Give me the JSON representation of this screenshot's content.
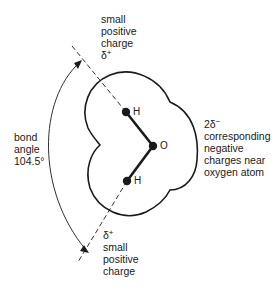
{
  "diagram": {
    "type": "water molecule polarity diagram",
    "atoms": {
      "hydrogen_top": "H",
      "hydrogen_bottom": "H",
      "oxygen": "O"
    },
    "top_label": {
      "line1": "small",
      "line2": "positive",
      "line3": "charge",
      "delta": "δ",
      "delta_sup": "+"
    },
    "bottom_label": {
      "delta": "δ",
      "delta_sup": "+",
      "line1": "small",
      "line2": "positive",
      "line3": "charge"
    },
    "right_label": {
      "delta": "2δ",
      "delta_sup": "−",
      "line1": "corresponding",
      "line2": "negative",
      "line3": "charges near",
      "line4": "oxygen atom"
    },
    "angle_label": {
      "line1": "bond",
      "line2": "angle",
      "line3": "104.5°"
    },
    "colors": {
      "stroke": "#1a1a1a",
      "background": "#ffffff"
    }
  }
}
